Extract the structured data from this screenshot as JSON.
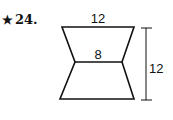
{
  "problem": {
    "star": "★",
    "number": "24."
  },
  "figure": {
    "type": "two stacked trapezoids (hourglass shape)",
    "top_base_label": "12",
    "middle_base_label": "8",
    "height_label": "12",
    "stroke_color": "#111111"
  }
}
